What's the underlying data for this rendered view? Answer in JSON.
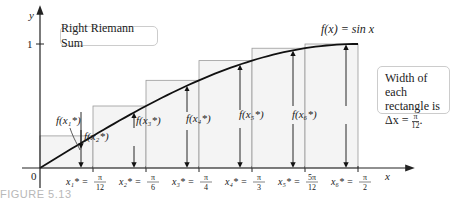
{
  "title_box": {
    "label": "Right Riemann Sum"
  },
  "function_label": "f(x) = sin x",
  "axes": {
    "x_label": "x",
    "y_label": "y",
    "origin_label": "0",
    "y_tick_label": "1"
  },
  "width_box": {
    "line1": "Width of each",
    "line2": "rectangle is",
    "delta_prefix": "Δx = ",
    "num": "π",
    "den": "12",
    "suffix": "."
  },
  "caption": "FIGURE 5.13",
  "colors": {
    "rect_fill": "#f4f4f4",
    "rect_stroke": "#9a9a9a",
    "curve": "#111111",
    "axis": "#222222"
  },
  "points": [
    {
      "x_label": "x₁* = ",
      "num": "π",
      "den": "12",
      "f_label": "f(x₁*)",
      "value": 0.2588
    },
    {
      "x_label": "x₂* = ",
      "num": "π",
      "den": "6",
      "f_label": "f(x₂*)",
      "value": 0.5
    },
    {
      "x_label": "x₃* = ",
      "num": "π",
      "den": "4",
      "f_label": "f(x₃*)",
      "value": 0.7071
    },
    {
      "x_label": "x₄* = ",
      "num": "π",
      "den": "3",
      "f_label": "f(x₄*)",
      "value": 0.866
    },
    {
      "x_label": "x₅* = ",
      "num": "5π",
      "den": "12",
      "f_label": "f(x₅*)",
      "value": 0.9659
    },
    {
      "x_label": "x₆* = ",
      "num": "π",
      "den": "2",
      "f_label": "f(x₆*)",
      "value": 1.0
    }
  ]
}
